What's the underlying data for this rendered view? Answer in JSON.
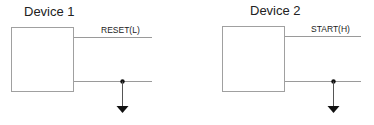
{
  "devices": [
    {
      "title": "Device 1",
      "signal_label": "RESET(L)"
    },
    {
      "title": "Device 2",
      "signal_label": "START(H)"
    }
  ],
  "colors": {
    "box_stroke": "#a0a0a0",
    "wire": "#9a9a9a",
    "ground": "#111111"
  }
}
